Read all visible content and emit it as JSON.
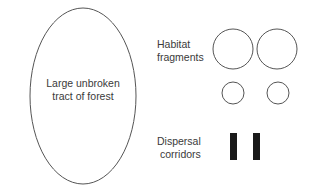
{
  "forest": {
    "label_line1": "Large unbroken",
    "label_line2": "tract of forest"
  },
  "fragments": {
    "label_line1": "Habitat",
    "label_line2": "fragments"
  },
  "corridors": {
    "label_line1": "Dispersal",
    "label_line2": "corridors"
  },
  "colors": {
    "stroke": "#555555",
    "bar": "#1a1a1a"
  }
}
